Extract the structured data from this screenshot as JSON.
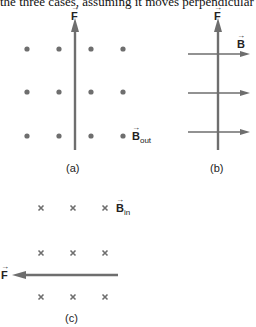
{
  "caption": "the three cases, assuming it moves perpendicular to B.",
  "colors": {
    "arrow": "#6e6e6e",
    "dot": "#6e6e6e",
    "text": "#222222"
  },
  "panels": {
    "a": {
      "label": "(a)",
      "force_label": "F",
      "field_label": "B",
      "field_sub": "out",
      "dots": [
        [
          27,
          49
        ],
        [
          59,
          49
        ],
        [
          91,
          49
        ],
        [
          123,
          49
        ],
        [
          27,
          92
        ],
        [
          59,
          92
        ],
        [
          91,
          92
        ],
        [
          123,
          92
        ],
        [
          27,
          136
        ],
        [
          59,
          136
        ],
        [
          91,
          136
        ],
        [
          123,
          136
        ]
      ]
    },
    "b": {
      "label": "(b)",
      "force_label": "F",
      "field_label": "B",
      "field_lines_y": [
        54,
        93,
        132
      ]
    },
    "c": {
      "label": "(c)",
      "force_label": "F",
      "field_label": "B",
      "field_sub": "in",
      "crosses": [
        [
          41,
          208
        ],
        [
          73,
          208
        ],
        [
          105,
          208
        ],
        [
          41,
          253
        ],
        [
          73,
          253
        ],
        [
          105,
          253
        ],
        [
          41,
          297
        ],
        [
          73,
          297
        ],
        [
          105,
          297
        ]
      ]
    }
  }
}
